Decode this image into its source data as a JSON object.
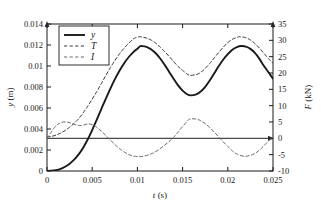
{
  "chart_data": {
    "type": "line",
    "title": "",
    "xlabel": "t (s)",
    "ylabel": "y (m)",
    "y2label": "F (kN)",
    "xlim": [
      0,
      0.025
    ],
    "ylim": [
      0,
      0.014
    ],
    "y2lim": [
      -10,
      35
    ],
    "grid": false,
    "legend_position": "upper-left",
    "xticks": [
      0,
      0.005,
      0.01,
      0.015,
      0.02,
      0.025
    ],
    "xticklabels": [
      "0",
      "0.005",
      "0.01",
      "0.015",
      "0.02",
      "0.025"
    ],
    "yticks": [
      0,
      0.002,
      0.004,
      0.006,
      0.008,
      0.01,
      0.012,
      0.014
    ],
    "yticklabels": [
      "0",
      "0.002",
      "0.004",
      "0.006",
      "0.008",
      "0.01",
      "0.012",
      "0.014"
    ],
    "y2ticks": [
      -10,
      -5,
      0,
      5,
      10,
      15,
      20,
      25,
      30,
      35
    ],
    "y2ticklabels": [
      "-10",
      "-5",
      "0",
      "5",
      "10",
      "15",
      "20",
      "25",
      "30",
      "35"
    ],
    "zero_line_axis": "right",
    "zero_line_value": 0,
    "series": [
      {
        "name": "y",
        "label": "y",
        "axis": "left",
        "style": "solid",
        "color": "#1a1a1a",
        "width": 1.9,
        "x": [
          0,
          0.0005,
          0.001,
          0.0015,
          0.002,
          0.0025,
          0.003,
          0.0035,
          0.004,
          0.0045,
          0.005,
          0.0055,
          0.006,
          0.0065,
          0.007,
          0.0075,
          0.008,
          0.0085,
          0.009,
          0.0095,
          0.01,
          0.0103,
          0.0105,
          0.011,
          0.0115,
          0.012,
          0.0125,
          0.013,
          0.0135,
          0.014,
          0.0145,
          0.015,
          0.0155,
          0.0159,
          0.0165,
          0.017,
          0.0175,
          0.018,
          0.0185,
          0.019,
          0.0195,
          0.02,
          0.0205,
          0.021,
          0.0215,
          0.022,
          0.0225,
          0.023,
          0.0235,
          0.024,
          0.0245,
          0.025
        ],
        "values": [
          0,
          2e-05,
          8e-05,
          0.0002,
          0.0004,
          0.0007,
          0.00108,
          0.00158,
          0.00222,
          0.003,
          0.0039,
          0.00487,
          0.00588,
          0.00688,
          0.00783,
          0.00872,
          0.00952,
          0.01022,
          0.01081,
          0.01128,
          0.01165,
          0.01188,
          0.0119,
          0.01183,
          0.0116,
          0.01124,
          0.01074,
          0.01013,
          0.00946,
          0.00878,
          0.00815,
          0.00766,
          0.00731,
          0.0072,
          0.00729,
          0.00757,
          0.00802,
          0.00862,
          0.0093,
          0.00999,
          0.01062,
          0.01113,
          0.01155,
          0.0118,
          0.0119,
          0.01185,
          0.01163,
          0.01124,
          0.01068,
          0.01,
          0.0094,
          0.0088
        ]
      },
      {
        "name": "T",
        "label": "T",
        "axis": "right",
        "style": "dashed",
        "color": "#3a3a3a",
        "width": 1.0,
        "x": [
          0,
          0.0005,
          0.001,
          0.0015,
          0.002,
          0.0025,
          0.003,
          0.0035,
          0.004,
          0.0045,
          0.005,
          0.0055,
          0.006,
          0.0065,
          0.007,
          0.0075,
          0.008,
          0.0085,
          0.009,
          0.0095,
          0.0098,
          0.0102,
          0.0105,
          0.011,
          0.0115,
          0.012,
          0.0125,
          0.013,
          0.0135,
          0.014,
          0.0145,
          0.015,
          0.0155,
          0.0158,
          0.0165,
          0.017,
          0.0175,
          0.018,
          0.0185,
          0.019,
          0.0195,
          0.02,
          0.0205,
          0.021,
          0.0213,
          0.022,
          0.0225,
          0.023,
          0.0235,
          0.024,
          0.0245,
          0.025
        ],
        "values": [
          0.4,
          0.6,
          1.0,
          1.6,
          2.4,
          3.4,
          4.6,
          6.0,
          7.8,
          9.8,
          12.0,
          14.3,
          16.7,
          19.2,
          21.6,
          23.8,
          25.8,
          27.5,
          29.0,
          30.3,
          30.8,
          31.1,
          31.0,
          30.7,
          30.1,
          29.2,
          28.0,
          26.6,
          25.1,
          23.5,
          22.0,
          20.8,
          19.7,
          19.3,
          19.5,
          20.2,
          21.4,
          22.9,
          24.6,
          26.3,
          27.9,
          29.3,
          30.3,
          30.9,
          31.1,
          30.8,
          30.1,
          29.0,
          27.6,
          26.0,
          24.4,
          23.0
        ]
      },
      {
        "name": "I",
        "label": "I",
        "axis": "right",
        "style": "dashed",
        "color": "#6b6b6b",
        "width": 1.0,
        "x": [
          0,
          0.0004,
          0.0008,
          0.0012,
          0.0016,
          0.0022,
          0.0026,
          0.003,
          0.0034,
          0.0038,
          0.0042,
          0.0046,
          0.005,
          0.0055,
          0.006,
          0.0065,
          0.007,
          0.0075,
          0.008,
          0.0085,
          0.009,
          0.0095,
          0.0102,
          0.0108,
          0.0115,
          0.012,
          0.0125,
          0.013,
          0.0135,
          0.014,
          0.0145,
          0.015,
          0.0155,
          0.0158,
          0.0165,
          0.017,
          0.0175,
          0.018,
          0.0185,
          0.019,
          0.0195,
          0.02,
          0.0205,
          0.021,
          0.0218,
          0.0225,
          0.023,
          0.0235,
          0.024,
          0.0245,
          0.025
        ],
        "values": [
          0.0,
          1.6,
          3.2,
          4.3,
          4.9,
          5.0,
          4.7,
          4.3,
          4.0,
          3.9,
          4.2,
          4.4,
          4.2,
          3.4,
          2.2,
          0.9,
          -0.5,
          -1.9,
          -3.1,
          -4.1,
          -4.9,
          -5.4,
          -5.6,
          -5.4,
          -4.8,
          -4.1,
          -3.2,
          -2.1,
          -1.0,
          0.3,
          1.9,
          3.6,
          5.2,
          5.9,
          5.9,
          5.4,
          4.5,
          3.3,
          1.9,
          0.4,
          -1.1,
          -2.5,
          -3.8,
          -4.8,
          -5.5,
          -5.2,
          -4.6,
          -3.6,
          -2.3,
          -0.8,
          0.4
        ]
      }
    ]
  },
  "legend": {
    "entries": [
      {
        "label": "y",
        "style": "solid"
      },
      {
        "label": "T",
        "style": "dashed"
      },
      {
        "label": "I",
        "style": "dashed"
      }
    ]
  },
  "axes": {
    "x_title_var": "t",
    "x_title_unit": "(s)",
    "y_title_var": "y",
    "y_title_unit": "(m)",
    "y2_title_var": "F",
    "y2_title_unit": "(kN)"
  },
  "colors": {
    "axis": "#1a1a1a",
    "series_y": "#1a1a1a",
    "series_T": "#3a3a3a",
    "series_I": "#6b6b6b",
    "background": "#ffffff"
  }
}
